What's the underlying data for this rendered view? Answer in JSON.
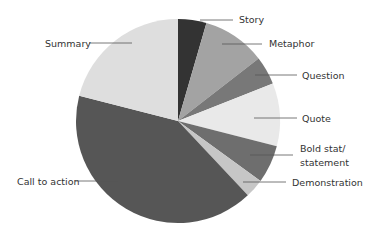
{
  "chart_data": {
    "type": "pie",
    "title": "",
    "start_angle_deg": 0,
    "direction": "clockwise",
    "slices": [
      {
        "label": "Story",
        "value": 4.5,
        "color": "#333333"
      },
      {
        "label": "Metaphor",
        "value": 10,
        "color": "#a3a3a3"
      },
      {
        "label": "Question",
        "value": 4.5,
        "color": "#787878"
      },
      {
        "label": "Quote",
        "value": 10,
        "color": "#e9e9e9"
      },
      {
        "label": "Bold stat/ statement",
        "value": 6,
        "color": "#6e6e6e"
      },
      {
        "label": "Demonstration",
        "value": 3,
        "color": "#c6c6c6"
      },
      {
        "label": "Call to action",
        "value": 41,
        "color": "#565656"
      },
      {
        "label": "Summary",
        "value": 21,
        "color": "#dedede"
      }
    ]
  },
  "labels": {
    "story": "Story",
    "metaphor": "Metaphor",
    "question": "Question",
    "quote": "Quote",
    "bold_line1": "Bold stat/",
    "bold_line2": "statement",
    "demonstration": "Demonstration",
    "call_to_action": "Call to action",
    "summary": "Summary"
  }
}
